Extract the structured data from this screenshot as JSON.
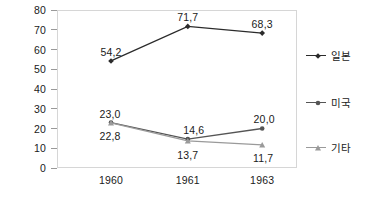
{
  "chart_data": {
    "type": "line",
    "title": "",
    "xlabel": "",
    "ylabel": "",
    "categories": [
      "1960",
      "1961",
      "1963"
    ],
    "ylim": [
      0,
      80
    ],
    "yticks": [
      "0",
      "10",
      "20",
      "30",
      "40",
      "50",
      "60",
      "70",
      "80"
    ],
    "grid": false,
    "legend_position": "right",
    "series": [
      {
        "name": "일본",
        "marker": "diamond",
        "color": "#2b2b2b",
        "values": [
          54.2,
          71.7,
          68.3
        ],
        "labels": [
          "54,2",
          "71,7",
          "68,3"
        ]
      },
      {
        "name": "미국",
        "marker": "circle",
        "color": "#555555",
        "values": [
          23.0,
          14.6,
          20.0
        ],
        "labels": [
          "23,0",
          "14,6",
          "20,0"
        ]
      },
      {
        "name": "기타",
        "marker": "triangle",
        "color": "#9a9a9a",
        "values": [
          22.8,
          13.7,
          11.7
        ],
        "labels": [
          "22,8",
          "13,7",
          "11,7"
        ]
      }
    ]
  },
  "legend": {
    "items": [
      {
        "label": "일본"
      },
      {
        "label": "미국"
      },
      {
        "label": "기타"
      }
    ]
  },
  "axis": {
    "y_ticks": [
      "80",
      "70",
      "60",
      "50",
      "40",
      "30",
      "20",
      "10",
      "0"
    ],
    "x_ticks": [
      "1960",
      "1961",
      "1963"
    ]
  },
  "colors": {
    "series_japan": "#2b2b2b",
    "series_usa": "#555555",
    "series_other": "#9a9a9a",
    "frame": "#d6d6d6",
    "text": "#1a1a1a",
    "background": "#ffffff"
  }
}
